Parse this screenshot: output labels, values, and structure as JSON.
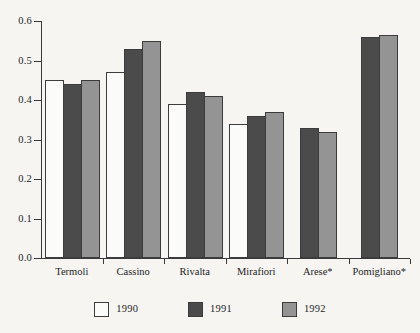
{
  "chart_data": {
    "type": "bar",
    "title": "",
    "subtitle": "",
    "xlabel": "",
    "ylabel": "",
    "categories": [
      "Termoli",
      "Cassino",
      "Rivalta",
      "Mirafiori",
      "Arese*",
      "Pomigliano*"
    ],
    "series": [
      {
        "name": "1990",
        "color": "#fbfbf9",
        "values": [
          0.45,
          0.47,
          0.39,
          0.34,
          null,
          null
        ]
      },
      {
        "name": "1991",
        "color": "#4b4b4b",
        "values": [
          0.44,
          0.53,
          0.42,
          0.36,
          0.33,
          0.56
        ]
      },
      {
        "name": "1992",
        "color": "#949494",
        "values": [
          0.45,
          0.55,
          0.41,
          0.37,
          0.32,
          0.565
        ]
      }
    ],
    "ylim": [
      0.0,
      0.6
    ],
    "ytick_values": [
      0.0,
      0.1,
      0.2,
      0.3,
      0.4,
      0.5,
      0.6
    ],
    "ytick_labels": [
      "0.0",
      "0.1",
      "0.2",
      "0.3",
      "0.4",
      "0.5",
      "0.6"
    ],
    "grid": false,
    "legend_position": "bottom-center",
    "legend_entries": [
      "1990",
      "1991",
      "1992"
    ],
    "annotations": []
  },
  "colors": {
    "background": "#f6f5f2",
    "axis": "#3a3a3a",
    "bar_outline": "#3c3c3c",
    "text": "#1d1d1d"
  }
}
